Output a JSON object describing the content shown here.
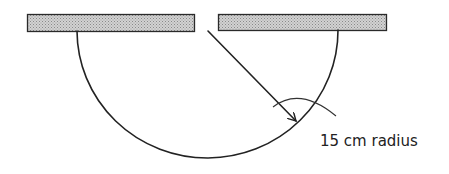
{
  "diagram": {
    "type": "semicircular-loop-between-two-bars",
    "elements": [
      {
        "name": "left-bar",
        "kind": "hatched-bar"
      },
      {
        "name": "right-bar",
        "kind": "hatched-bar"
      },
      {
        "name": "semicircle",
        "kind": "curve"
      },
      {
        "name": "radius-arrow",
        "kind": "arrow"
      },
      {
        "name": "leader-arc",
        "kind": "annotation-leader"
      }
    ],
    "labels": {
      "radius": "15 cm radius"
    },
    "colors": {
      "stroke": "#222222",
      "bar_fill": "#c8c8c8",
      "background": "#ffffff"
    }
  }
}
